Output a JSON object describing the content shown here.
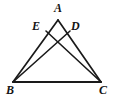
{
  "figure": {
    "background_color": "#ffffff",
    "stroke_color": "#1a1a1a",
    "labels": {
      "A": "A",
      "B": "B",
      "C": "C",
      "D": "D",
      "E": "E"
    },
    "points": {
      "A": {
        "x": 58,
        "y": 20
      },
      "B": {
        "x": 13,
        "y": 82
      },
      "C": {
        "x": 101,
        "y": 82
      },
      "D": {
        "x": 70,
        "y": 31
      },
      "E": {
        "x": 46,
        "y": 31
      },
      "intersection": {
        "x": 58,
        "y": 46
      }
    },
    "segments": [
      {
        "name": "side-AB",
        "from": "A",
        "to": "B"
      },
      {
        "name": "side-AC",
        "from": "A",
        "to": "C"
      },
      {
        "name": "base-BC",
        "from": "B",
        "to": "C"
      },
      {
        "name": "cevian-EC",
        "from": "E",
        "to": "C"
      },
      {
        "name": "cevian-DB",
        "from": "D",
        "to": "B"
      }
    ]
  }
}
